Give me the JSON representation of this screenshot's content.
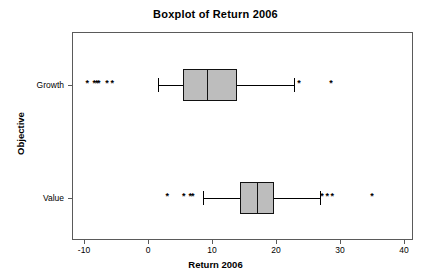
{
  "chart_data": {
    "type": "boxplot",
    "title": "Boxplot of Return 2006",
    "xlabel": "Return 2006",
    "ylabel": "Objective",
    "orientation": "horizontal",
    "grid": false,
    "legend": "none",
    "xlim": [
      -13,
      42
    ],
    "xticks": [
      -10,
      0,
      10,
      20,
      30,
      40
    ],
    "xtick_labels": [
      "-10",
      "0",
      "10",
      "20",
      "30",
      "40"
    ],
    "categories": [
      "Growth",
      "Value"
    ],
    "boxes": [
      {
        "name": "Growth",
        "whisker_low": 1.5,
        "q1": 5.5,
        "median": 9.2,
        "q3": 13.9,
        "whisker_high": 22.8,
        "outliers": [
          -9.5,
          -8.4,
          -8.0,
          -7.7,
          -6.4,
          -5.6,
          23.6,
          28.6
        ]
      },
      {
        "name": "Value",
        "whisker_low": 8.6,
        "q1": 14.4,
        "median": 17.0,
        "q3": 19.7,
        "whisker_high": 26.9,
        "outliers": [
          3.0,
          5.6,
          6.6,
          7.0,
          27.2,
          28.0,
          28.8,
          35.0
        ]
      }
    ],
    "colors": {
      "box_fill": "#bdbdbd",
      "box_edge": "#111111",
      "frame": "#5a5a5a",
      "whisker": "#000000",
      "outlier": "#000000"
    },
    "outlier_marker": "*"
  }
}
